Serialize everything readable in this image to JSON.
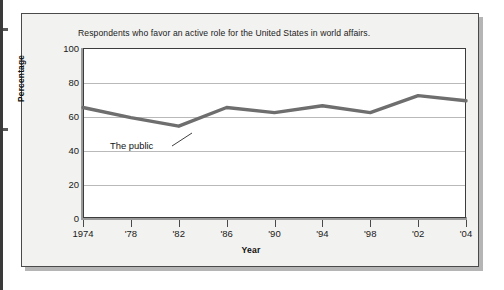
{
  "figure": {
    "title": "Respondents who favor an active role for the United States in world affairs.",
    "annotation_label": "The public",
    "line_color": "#6e6e6e",
    "grid_color": "#b9b9b9",
    "frame_color": "#4a4a4a",
    "plot_background": "#ffffff",
    "card_background": "#f2f2f0"
  },
  "chart_data": {
    "type": "line",
    "title": "Respondents who favor an active role for the United States in world affairs.",
    "xlabel": "Year",
    "ylabel": "Percentage",
    "xlim": [
      1974,
      2004
    ],
    "ylim": [
      0,
      100
    ],
    "grid": true,
    "legend": "none",
    "y_ticks": [
      100,
      80,
      60,
      40,
      20,
      0
    ],
    "y_tick_labels": [
      "100",
      "80",
      "60",
      "40",
      "20",
      "0"
    ],
    "x_ticks": [
      1974,
      1978,
      1982,
      1986,
      1990,
      1994,
      1998,
      2002,
      2004
    ],
    "x_tick_labels": [
      "1974",
      "'78",
      "'82",
      "'86",
      "'90",
      "'94",
      "'98",
      "'02",
      "'04"
    ],
    "series": [
      {
        "name": "The public",
        "color": "#6e6e6e",
        "x": [
          1974,
          1978,
          1982,
          1986,
          1990,
          1994,
          1998,
          2002,
          2004
        ],
        "values": [
          65,
          59,
          54,
          65,
          62,
          66,
          62,
          72,
          69
        ]
      }
    ],
    "annotations": [
      {
        "text": "The public",
        "points_to_year": 1982,
        "points_to_value": 54
      }
    ]
  }
}
